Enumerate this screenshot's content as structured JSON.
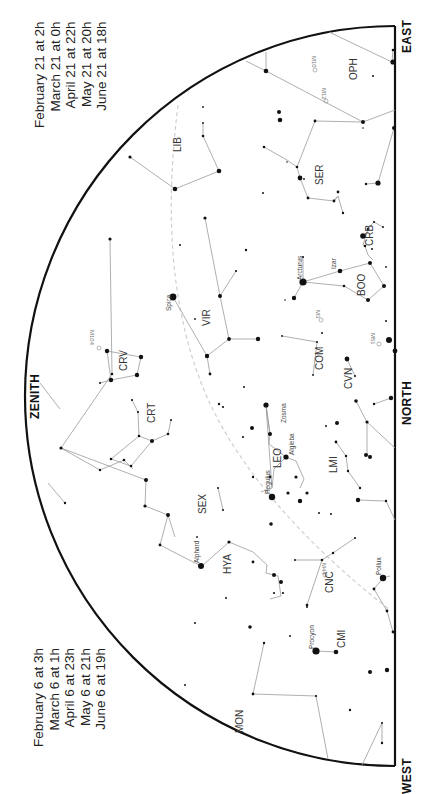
{
  "time_blocks": {
    "top": [
      "February 21 at   2h",
      "March 21 at   0h",
      "April 21 at 22h",
      "May 21 at 20h",
      "June 21 at 18h"
    ],
    "bottom": [
      "February 6 at   3h",
      "March 6 at   1h",
      "April 6 at 23h",
      "May 6 at 21h",
      "June 6 at 19h"
    ]
  },
  "directions": {
    "east": "EAST",
    "north": "NORTH",
    "west": "WEST",
    "zenith": "ZENITH"
  },
  "colors": {
    "horizon": "#111111",
    "lines": "#9a9a9a",
    "stars": "#111111",
    "ecliptic": "#cccccc",
    "text": "#333333"
  },
  "constellations": [
    {
      "name": "OPH",
      "x": 353,
      "y": 72
    },
    {
      "name": "LIB",
      "x": 180,
      "y": 144
    },
    {
      "name": "SER",
      "x": 320,
      "y": 177
    },
    {
      "name": "CRB",
      "x": 370,
      "y": 238
    },
    {
      "name": "BOO",
      "x": 362,
      "y": 288
    },
    {
      "name": "VIR",
      "x": 207,
      "y": 318
    },
    {
      "name": "COM",
      "x": 320,
      "y": 362
    },
    {
      "name": "CVN",
      "x": 349,
      "y": 381
    },
    {
      "name": "CRV",
      "x": 124,
      "y": 363
    },
    {
      "name": "CRT",
      "x": 152,
      "y": 415
    },
    {
      "name": "LEO",
      "x": 278,
      "y": 460
    },
    {
      "name": "LMI",
      "x": 334,
      "y": 465
    },
    {
      "name": "SEX",
      "x": 203,
      "y": 506
    },
    {
      "name": "HYA",
      "x": 228,
      "y": 566
    },
    {
      "name": "CNC",
      "x": 330,
      "y": 585
    },
    {
      "name": "CMI",
      "x": 342,
      "y": 640
    },
    {
      "name": "MON",
      "x": 240,
      "y": 725
    }
  ],
  "named_stars": [
    {
      "name": "Arcturus",
      "x": 302,
      "y": 282
    },
    {
      "name": "Izar",
      "x": 337,
      "y": 276
    },
    {
      "name": "Spica",
      "x": 173,
      "y": 297
    },
    {
      "name": "Zosma",
      "x": 288,
      "y": 415
    },
    {
      "name": "Algieba",
      "x": 291,
      "y": 453
    },
    {
      "name": "Regulus",
      "x": 271,
      "y": 488
    },
    {
      "name": "Alphard",
      "x": 201,
      "y": 561
    },
    {
      "name": "Pollux",
      "x": 382,
      "y": 570
    },
    {
      "name": "Procyon",
      "x": 316,
      "y": 648
    }
  ],
  "deep_sky": [
    {
      "name": "M10",
      "x": 315,
      "y": 63
    },
    {
      "name": "M12",
      "x": 326,
      "y": 94
    },
    {
      "name": "M104",
      "x": 93,
      "y": 342
    },
    {
      "name": "M3",
      "x": 319,
      "y": 317
    },
    {
      "name": "M51",
      "x": 374,
      "y": 339
    },
    {
      "name": "M44",
      "x": 318,
      "y": 577
    }
  ]
}
